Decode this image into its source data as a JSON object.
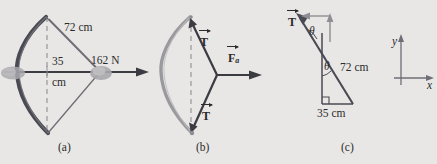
{
  "figure": {
    "caption_tags": [
      "(a)",
      "(b)",
      "(c)"
    ],
    "background_color": "#e8e7e5",
    "ink_color": "#2b2b2b",
    "bow_dark_color": "#4a4a52",
    "bow_light_color": "#9a9a9e",
    "arrow_color": "#3b3b42"
  },
  "panel_a": {
    "tag": "(a)",
    "label_draw_length": "72 cm",
    "label_draw_distance_line1": "35",
    "label_draw_distance_line2": "cm",
    "label_force": "162 N",
    "description": "bow drawn with arrow, 35 cm draw distance, 72 cm string half-length, 162 N applied force"
  },
  "panel_b": {
    "tag": "(b)",
    "label_tension_upper": "T",
    "label_tension_lower": "T",
    "label_applied_force": "F",
    "label_applied_force_subscript": "a",
    "description": "free-body diagram of nock point: two string tensions and applied force"
  },
  "panel_c": {
    "tag": "(c)",
    "label_tension": "T",
    "label_angle_upper": "θ",
    "label_angle_lower": "θ",
    "label_hypotenuse": "72 cm",
    "label_base": "35 cm",
    "axis_y": "y",
    "axis_x": "x",
    "description": "geometry triangle with angle theta, 72 cm hypotenuse, 35 cm base, and xy axes"
  }
}
